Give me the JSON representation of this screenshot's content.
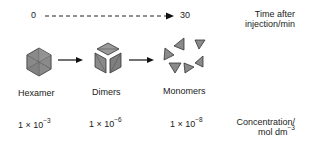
{
  "timeline": {
    "start_label": "0",
    "end_label": "30",
    "axis_label_line1": "Time after",
    "axis_label_line2": "injection/min"
  },
  "species": [
    {
      "name": "Hexamer",
      "icon": "hexamer-hexagon-icon",
      "concentration_base": "1 × 10",
      "concentration_exp": "−3"
    },
    {
      "name": "Dimers",
      "icon": "dimer-cube-icon",
      "concentration_base": "1 × 10",
      "concentration_exp": "−6"
    },
    {
      "name": "Monomers",
      "icon": "monomer-triangles-icon",
      "concentration_base": "1 × 10",
      "concentration_exp": "−8"
    }
  ],
  "concentration_label": {
    "line1": "Concentration/",
    "line2_base": "mol dm",
    "line2_exp": "−3"
  },
  "colors": {
    "shape_fill": "#8a8a8a",
    "shape_stroke": "#333333",
    "arrow": "#111111",
    "text": "#222222"
  }
}
